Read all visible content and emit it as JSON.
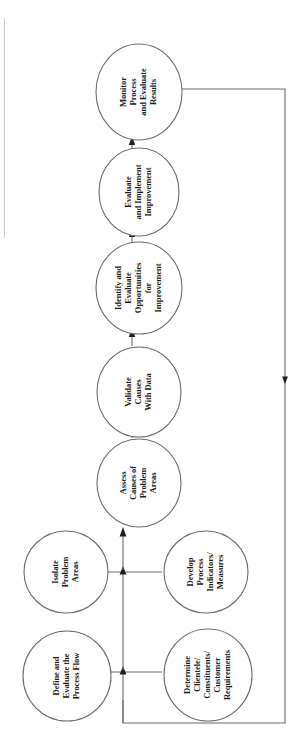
{
  "diagram": {
    "orientation": "rotated-90-ccw",
    "background_color": "#ffffff",
    "stroke_color": "#3a3a3a",
    "text_color": "#1a1a1a",
    "nodes": [
      {
        "id": "monitor-process-and-evaluate-results",
        "name": "Monitor Process and Evaluate Results",
        "lines": [
          "Monitor",
          "Process",
          "and Evaluate",
          "Results"
        ],
        "cx": 139,
        "cy": 92,
        "rx": 43,
        "ry": 48
      },
      {
        "id": "evaluate-and-implement-improvement",
        "name": "Evaluate and Implement Improvement",
        "lines": [
          "Evaluate",
          "and Implement",
          "Improvement"
        ],
        "cx": 139,
        "cy": 192,
        "rx": 40,
        "ry": 44
      },
      {
        "id": "identify-and-evaluate-opportunities-for-improvement",
        "name": "Identify and Evaluate Opportunities for Improvement",
        "lines": [
          "Identify and",
          "Evaluate",
          "Opportunities",
          "for",
          "Improvement"
        ],
        "cx": 139,
        "cy": 288,
        "rx": 43,
        "ry": 46
      },
      {
        "id": "validate-causes-with-data",
        "name": "Validate Causes With Data",
        "lines": [
          "Validate",
          "Causes",
          "With Data"
        ],
        "cx": 139,
        "cy": 392,
        "rx": 42,
        "ry": 45
      },
      {
        "id": "assess-causes-of-problem-areas",
        "name": "Assess Causes of Problem Areas",
        "lines": [
          "Assess",
          "Causes of",
          "Problem",
          "Areas"
        ],
        "cx": 139,
        "cy": 483,
        "rx": 42,
        "ry": 44
      },
      {
        "id": "isolate-problem-areas",
        "name": "Isolate Problem Areas",
        "lines": [
          "Isolate",
          "Problem",
          "Areas"
        ],
        "cx": 66,
        "cy": 572,
        "rx": 42,
        "ry": 41
      },
      {
        "id": "develop-process-indicators-measures",
        "name": "Develop Process Indicators/Measures",
        "lines": [
          "Develop",
          "Process",
          "Indicators/",
          "Measures"
        ],
        "cx": 206,
        "cy": 572,
        "rx": 42,
        "ry": 41
      },
      {
        "id": "define-and-evaluate-the-process-flow",
        "name": "Define and Evaluate the Process Flow",
        "lines": [
          "Define and",
          "Evaluate the",
          "Process Flow"
        ],
        "cx": 67,
        "cy": 676,
        "rx": 44,
        "ry": 45
      },
      {
        "id": "determine-clientele-constituents-customer-requirements",
        "name": "Determine Clientele/Constituents/Customer Requirements",
        "lines": [
          "Determine",
          "Clientele/",
          "Constituents/",
          "Customer",
          "Requirements"
        ],
        "cx": 208,
        "cy": 675,
        "rx": 44,
        "ry": 46
      }
    ],
    "connectors": [
      {
        "id": "arrow-evaluate-to-monitor",
        "from": "evaluate-and-implement-improvement",
        "to": "monitor-process-and-evaluate-results",
        "kind": "arrow-up"
      },
      {
        "id": "arrow-identify-to-evaluate",
        "from": "identify-and-evaluate-opportunities-for-improvement",
        "to": "evaluate-and-implement-improvement",
        "kind": "arrow-up"
      },
      {
        "id": "arrow-validate-to-identify",
        "from": "validate-causes-with-data",
        "to": "identify-and-evaluate-opportunities-for-improvement",
        "kind": "arrow-up"
      },
      {
        "id": "arrow-assess-to-validate",
        "from": "assess-causes-of-problem-areas",
        "to": "validate-causes-with-data",
        "kind": "arrow-up"
      },
      {
        "id": "junction-isolate-develop-to-assess",
        "from": "isolate-problem-areas,develop-process-indicators-measures",
        "to": "assess-causes-of-problem-areas",
        "kind": "t-junction-arrow-up"
      },
      {
        "id": "junction-define-determine-to-upper",
        "from": "define-and-evaluate-the-process-flow,determine-clientele-constituents-customer-requirements",
        "to": "isolate-problem-areas,develop-process-indicators-measures",
        "kind": "t-junction-arrow-up"
      },
      {
        "id": "feedback-loop-monitor-to-start",
        "from": "monitor-process-and-evaluate-results",
        "to": "define-and-evaluate-the-process-flow",
        "kind": "feedback-loop-with-arrow"
      }
    ]
  }
}
